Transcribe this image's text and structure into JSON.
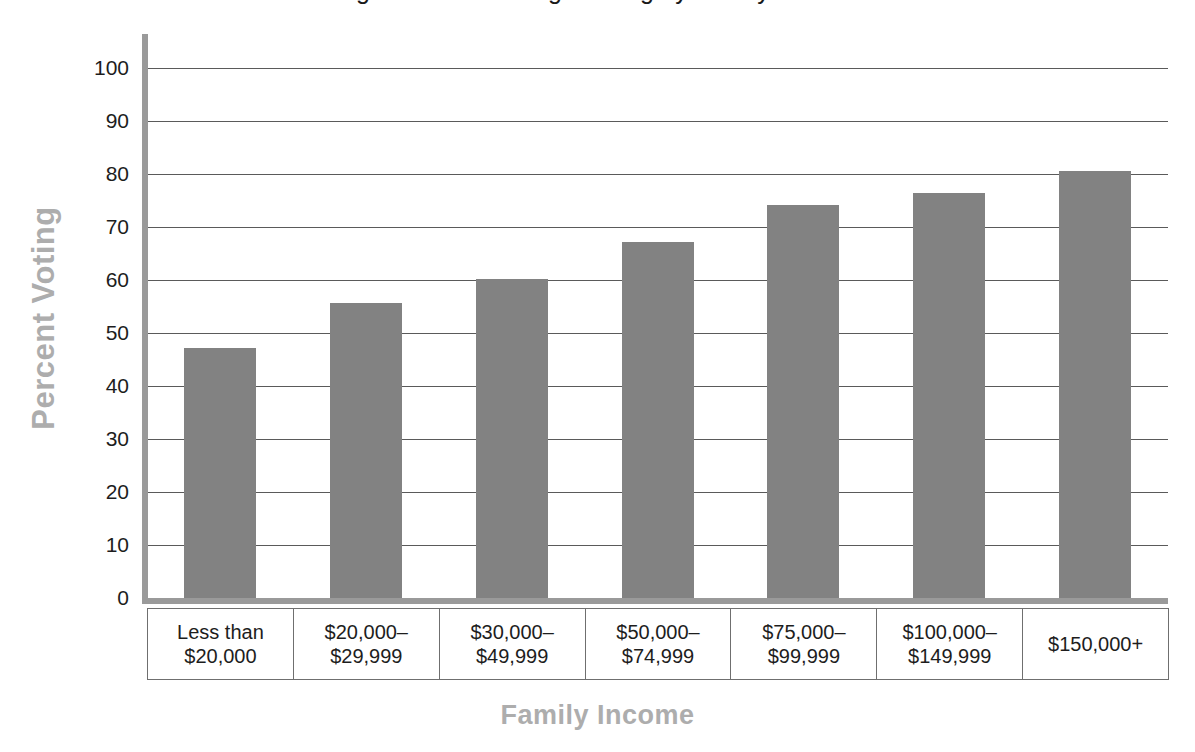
{
  "chart_data": {
    "type": "bar",
    "title": "Figure — Percentage Voting by Family Income",
    "xlabel": "Family Income",
    "ylabel": "Percent Voting",
    "categories": [
      "Less than $20,000",
      "$20,000–$29,999",
      "$30,000–$49,999",
      "$50,000–$74,999",
      "$75,000–$99,999",
      "$100,000–$149,999",
      "$150,000+"
    ],
    "category_lines": [
      [
        "Less than",
        "$20,000"
      ],
      [
        "$20,000–",
        "$29,999"
      ],
      [
        "$30,000–",
        "$49,999"
      ],
      [
        "$50,000–",
        "$74,999"
      ],
      [
        "$75,000–",
        "$99,999"
      ],
      [
        "$100,000–",
        "$149,999"
      ],
      [
        "$150,000+"
      ]
    ],
    "values": [
      47.2,
      55.7,
      60.2,
      67.2,
      74.2,
      76.4,
      80.5
    ],
    "ylim": [
      0,
      100
    ],
    "ytick_labels": [
      "100",
      "90",
      "80",
      "70",
      "60",
      "50",
      "40",
      "30",
      "20",
      "10",
      "0"
    ],
    "yticks": [
      100,
      90,
      80,
      70,
      60,
      50,
      40,
      30,
      20,
      10,
      0
    ],
    "grid": "horizontal",
    "legend": "none",
    "bar_color": "#828282",
    "axis_color": "#9a9a9a",
    "gridline_color": "#5a5a5a",
    "axis_title_color": "#adadad",
    "tick_label_color": "#1d1d1d"
  }
}
